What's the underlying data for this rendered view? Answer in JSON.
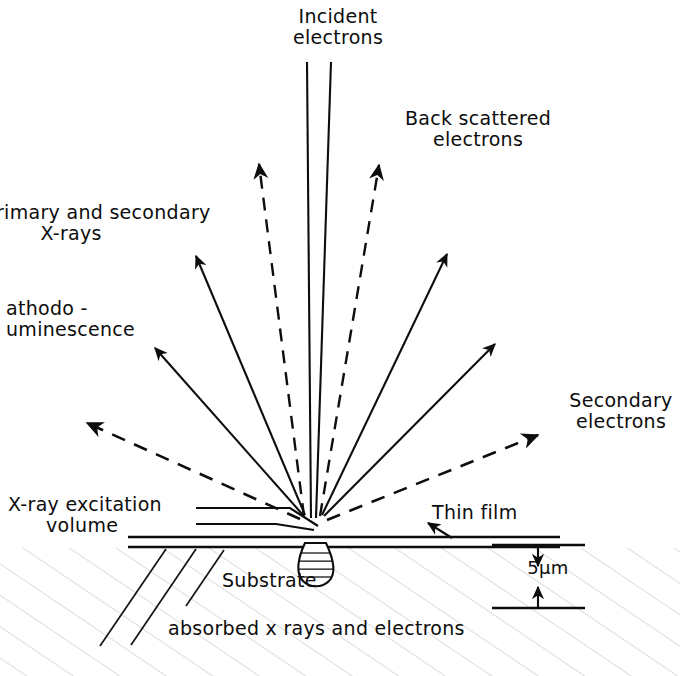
{
  "figure": {
    "stroke_color": "#0d0d0d",
    "background_color": "#ffffff"
  },
  "labels": {
    "incident_electrons": "Incident\nelectrons",
    "back_scattered_electrons": "Back scattered\nelectrons",
    "primary_secondary_xrays": "rimary and secondary\n       X-rays",
    "cathodoluminescence": "athodo -\numinescence",
    "secondary_electrons": "Secondary\nelectrons",
    "xray_excitation_volume": "X-ray excitation\n      volume",
    "thin_film": "Thin film",
    "substrate": "Substrate",
    "absorbed": "absorbed x rays and electrons",
    "scale_bar": "5μm"
  },
  "geometry": {
    "convergence_point": {
      "x": 313,
      "y": 521
    },
    "film_top_y": 537,
    "film_bottom_y": 547,
    "film_left_x": 128,
    "film_right_x": 560,
    "scale_bar": {
      "x_left": 492,
      "x_right": 585,
      "y_top": 545,
      "y_bottom": 608
    }
  },
  "rays": [
    {
      "name": "incident-beam-left",
      "kind": "solid-plain",
      "x1": 307,
      "y1": 62,
      "x2": 311,
      "y2": 518
    },
    {
      "name": "incident-beam-right",
      "kind": "solid-plain",
      "x1": 331,
      "y1": 62,
      "x2": 316,
      "y2": 518
    },
    {
      "name": "backscattered-left",
      "kind": "dashed-arrow",
      "x1": 304,
      "y1": 516,
      "x2": 259,
      "y2": 164
    },
    {
      "name": "backscattered-right",
      "kind": "dashed-arrow",
      "x1": 320,
      "y1": 516,
      "x2": 379,
      "y2": 165
    },
    {
      "name": "primary-xray-ray",
      "kind": "solid-arrow",
      "x1": 305,
      "y1": 515,
      "x2": 196,
      "y2": 256
    },
    {
      "name": "cathodoluminescence-ray",
      "kind": "solid-arrow",
      "x1": 303,
      "y1": 515,
      "x2": 155,
      "y2": 348
    },
    {
      "name": "right-emission-upper",
      "kind": "solid-arrow",
      "x1": 322,
      "y1": 515,
      "x2": 447,
      "y2": 254
    },
    {
      "name": "right-emission-lower",
      "kind": "solid-arrow",
      "x1": 324,
      "y1": 516,
      "x2": 495,
      "y2": 344
    },
    {
      "name": "secondary-electrons-left",
      "kind": "dashed-arrow",
      "x1": 300,
      "y1": 519,
      "x2": 87,
      "y2": 423
    },
    {
      "name": "secondary-electrons-right",
      "kind": "dashed-arrow",
      "x1": 327,
      "y1": 520,
      "x2": 538,
      "y2": 435
    }
  ],
  "leaders": [
    {
      "name": "xray-volume-leader-upper",
      "points": "196,508 290,508 318,526"
    },
    {
      "name": "xray-volume-leader-lower",
      "points": "196,524 276,524 314,530"
    },
    {
      "name": "thin-film-leader",
      "points": "452,538 430,524"
    }
  ],
  "excitation_volume": {
    "name": "excitation-volume-teardrop",
    "center_x": 315,
    "top_y": 545,
    "bottom_y": 585,
    "radius": 17,
    "internal_line_count": 5
  }
}
